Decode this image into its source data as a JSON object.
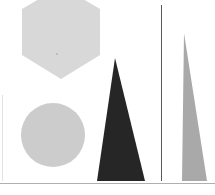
{
  "figure": {
    "width": 215,
    "height": 195,
    "background_color": "#ffffff"
  },
  "palette": {
    "hexagon_fill": "#d8d8d8",
    "circle_fill": "#cccccc",
    "dark_triangle_fill": "#262626",
    "light_triangle_fill": "#a9a9a9",
    "vertical_rule_color": "#595959",
    "baseline_color": "#b0b0b0",
    "left_rule_color": "#e2e2e2",
    "background_color": "#ffffff"
  },
  "shapes": [
    {
      "id": "hexagon",
      "name": "hexagon",
      "label": "Hexagon",
      "fill": "#d8d8d8",
      "points": "61,-14 100,9 100,55 61,79 22,55 22,9",
      "clipped_at_top": "true"
    },
    {
      "id": "circle",
      "name": "circle",
      "label": "Circle",
      "fill": "#cccccc",
      "cx": 53,
      "cy": 135,
      "r": 32
    },
    {
      "id": "dark-triangle",
      "name": "dark-narrow-triangle",
      "label": "Dark narrow triangle",
      "fill": "#262626",
      "points": "115,58 145,181 97,181"
    },
    {
      "id": "light-triangle",
      "name": "light-narrow-triangle",
      "label": "Light narrow triangle",
      "fill": "#a9a9a9",
      "points": "184,33 207,181 182,181"
    }
  ],
  "rules": [
    {
      "id": "vertical-rule",
      "name": "vertical-divider-line",
      "label": "Vertical divider line",
      "color": "#595959",
      "x1": 161.5,
      "y1": 5,
      "x2": 161.5,
      "y2": 181,
      "width": 1
    },
    {
      "id": "left-rule",
      "name": "left-edge-line",
      "label": "Left edge faint line",
      "color": "#e2e2e2",
      "x1": 2.5,
      "y1": 95,
      "x2": 2.5,
      "y2": 181,
      "width": 1
    },
    {
      "id": "baseline",
      "name": "horizontal-baseline",
      "label": "Horizontal baseline",
      "color": "#b0b0b0",
      "x1": 0,
      "y1": 183.5,
      "x2": 215,
      "y2": 183.5,
      "width": 1
    }
  ],
  "marks": [
    {
      "id": "hexagon-center-dot",
      "name": "hexagon-center-dot",
      "label": "Small dot inside hexagon",
      "color": "#8a8a8a",
      "cx": 57,
      "cy": 54,
      "r": 0.7
    }
  ]
}
